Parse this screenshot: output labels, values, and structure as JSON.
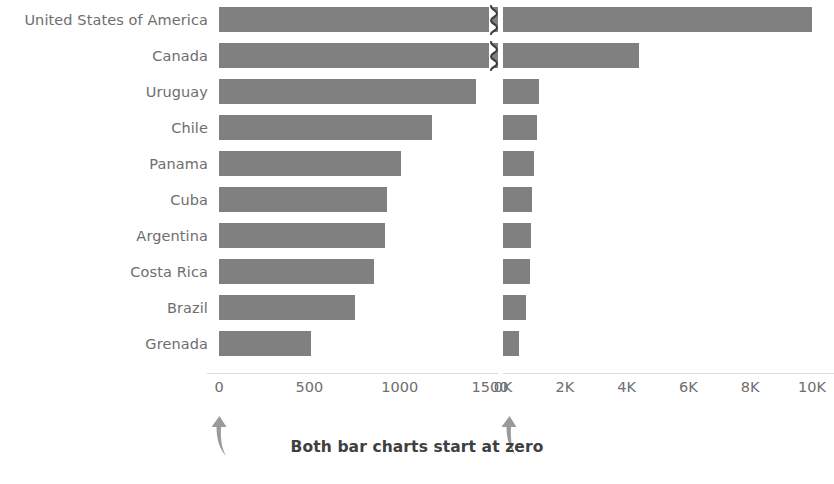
{
  "caption": {
    "text": "Both bar charts start at zero",
    "arrow_left_name": "up-arrow-icon",
    "arrow_right_name": "up-arrow-icon"
  },
  "colors": {
    "bar": "#808080",
    "label_text": "#6e6e6e",
    "axis_line": "#dcdcdc",
    "caption_text": "#404040",
    "background": "#ffffff"
  },
  "chart_data": [
    {
      "type": "bar",
      "title": "",
      "subtitle": "",
      "orientation": "horizontal",
      "panel": "left",
      "xlabel": "",
      "ylabel": "",
      "xlim": [
        0,
        1600
      ],
      "grid": false,
      "legend": null,
      "axis_break": true,
      "axis_break_note": "United States of America and Canada bars are truncated and marked with a zigzag break symbol",
      "tick_labels": [
        "0",
        "500",
        "1000",
        "1500"
      ],
      "tick_values": [
        0,
        500,
        1000,
        1500
      ],
      "categories": [
        "United States of America",
        "Canada",
        "Uruguay",
        "Chile",
        "Panama",
        "Cuba",
        "Argentina",
        "Costa Rica",
        "Brazil",
        "Grenada"
      ],
      "values": [
        1600,
        1600,
        1420,
        1180,
        1010,
        930,
        920,
        860,
        755,
        510
      ],
      "truncated": [
        true,
        true,
        false,
        false,
        false,
        false,
        false,
        false,
        false,
        false
      ]
    },
    {
      "type": "bar",
      "title": "",
      "subtitle": "",
      "orientation": "horizontal",
      "panel": "right",
      "xlabel": "",
      "ylabel": "",
      "xlim": [
        0,
        11000
      ],
      "grid": false,
      "legend": null,
      "axis_break": false,
      "tick_labels": [
        "0K",
        "2K",
        "4K",
        "6K",
        "8K",
        "10K"
      ],
      "tick_values": [
        0,
        2000,
        4000,
        6000,
        8000,
        10000
      ],
      "categories": [
        "United States of America",
        "Canada",
        "Uruguay",
        "Chile",
        "Panama",
        "Cuba",
        "Argentina",
        "Costa Rica",
        "Brazil",
        "Grenada"
      ],
      "values": [
        10000,
        4400,
        1150,
        1100,
        1010,
        930,
        920,
        860,
        755,
        510
      ]
    }
  ],
  "rows": [
    {
      "label": "United States of America"
    },
    {
      "label": "Canada"
    },
    {
      "label": "Uruguay"
    },
    {
      "label": "Chile"
    },
    {
      "label": "Panama"
    },
    {
      "label": "Cuba"
    },
    {
      "label": "Argentina"
    },
    {
      "label": "Costa Rica"
    },
    {
      "label": "Brazil"
    },
    {
      "label": "Grenada"
    }
  ]
}
